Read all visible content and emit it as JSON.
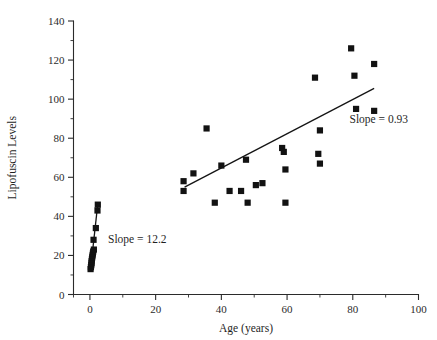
{
  "chart_data": {
    "type": "scatter",
    "title": "",
    "xlabel": "Age (years)",
    "ylabel": "Lipofuscin Levels",
    "xlim": [
      -5,
      100
    ],
    "ylim": [
      0,
      140
    ],
    "x_ticks": [
      0,
      20,
      40,
      60,
      80,
      100
    ],
    "y_ticks": [
      0,
      20,
      40,
      60,
      80,
      100,
      120,
      140
    ],
    "x_minor_ticks": [
      10,
      30,
      50,
      70,
      90
    ],
    "y_minor_ticks": [
      10,
      30,
      50,
      70,
      90,
      110,
      130
    ],
    "grid": false,
    "legend": false,
    "marker": "filled-square",
    "marker_color": "#121212",
    "series": [
      {
        "name": "Young group (left cluster)",
        "points": [
          [
            0.2,
            13
          ],
          [
            0.3,
            14
          ],
          [
            0.4,
            15
          ],
          [
            0.5,
            16
          ],
          [
            0.5,
            17
          ],
          [
            0.6,
            18
          ],
          [
            0.7,
            19
          ],
          [
            0.8,
            20
          ],
          [
            0.9,
            21
          ],
          [
            1.0,
            22
          ],
          [
            1.2,
            23
          ],
          [
            1.1,
            28
          ],
          [
            1.8,
            34
          ],
          [
            2.3,
            43
          ],
          [
            2.4,
            46
          ]
        ]
      },
      {
        "name": "Adult group (right cluster)",
        "points": [
          [
            28.5,
            58
          ],
          [
            28.5,
            53
          ],
          [
            31.5,
            62
          ],
          [
            35.5,
            85
          ],
          [
            38.0,
            47
          ],
          [
            40.0,
            66
          ],
          [
            42.5,
            53
          ],
          [
            46.0,
            53
          ],
          [
            47.5,
            69
          ],
          [
            48.0,
            47
          ],
          [
            50.5,
            56
          ],
          [
            52.5,
            57
          ],
          [
            58.5,
            75
          ],
          [
            59.0,
            73
          ],
          [
            59.5,
            64
          ],
          [
            59.5,
            47
          ],
          [
            68.5,
            111
          ],
          [
            69.5,
            72
          ],
          [
            70.0,
            84
          ],
          [
            70.0,
            67
          ],
          [
            79.5,
            126
          ],
          [
            80.5,
            112
          ],
          [
            81.0,
            95
          ],
          [
            86.5,
            118
          ],
          [
            86.5,
            94
          ]
        ]
      }
    ],
    "fit_lines": [
      {
        "name": "young-fit-line",
        "slope": 12.2,
        "x_start": 0.3,
        "y_start": 14.5,
        "x_end": 2.4,
        "y_end": 46.5,
        "annotation": "Slope = 12.2"
      },
      {
        "name": "adult-fit-line",
        "slope": 0.93,
        "x_start": 28.8,
        "y_start": 55.0,
        "x_end": 86.5,
        "y_end": 105.5,
        "annotation": "Slope = 0.93"
      }
    ],
    "annotations": [
      {
        "text": "Slope = 12.2",
        "x": 5.5,
        "y": 26.5
      },
      {
        "text": "Slope = 0.93",
        "x": 79.0,
        "y": 88.0
      }
    ]
  }
}
